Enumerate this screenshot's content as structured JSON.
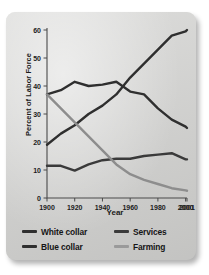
{
  "figure": {
    "panel_bg": "#d4d4d2",
    "page_bg": "#ffffff"
  },
  "chart_data": {
    "type": "line",
    "title": "",
    "xlabel": "Year",
    "ylabel": "Percent of Labor Force",
    "xlim": [
      1900,
      2001
    ],
    "ylim": [
      0,
      60
    ],
    "grid": false,
    "legend_position": "bottom",
    "x_tick_labels": [
      "1900",
      "1920",
      "1940",
      "1960",
      "1980",
      "2000",
      "2001"
    ],
    "x_tick_values": [
      1900,
      1920,
      1940,
      1960,
      1980,
      2000,
      2001
    ],
    "y_tick_labels": [
      "0",
      "10",
      "20",
      "30",
      "40",
      "50",
      "60"
    ],
    "y_tick_values": [
      0,
      10,
      20,
      30,
      40,
      50,
      60
    ],
    "x": [
      1900,
      1910,
      1920,
      1930,
      1940,
      1950,
      1960,
      1970,
      1980,
      1990,
      2000,
      2001
    ],
    "series": [
      {
        "name": "White collar",
        "color": "#2f2f2f",
        "values": [
          19,
          23,
          26,
          30,
          33,
          37,
          43,
          48,
          53,
          58,
          59.5,
          60
        ]
      },
      {
        "name": "Blue collar",
        "color": "#2f2f2f",
        "values": [
          37,
          38.5,
          41.5,
          40,
          40.5,
          41.5,
          38,
          37,
          32,
          28,
          25.5,
          25
        ]
      },
      {
        "name": "Services",
        "color": "#3a3a3a",
        "values": [
          11.5,
          11.5,
          9.8,
          12,
          13.5,
          14,
          14,
          15,
          15.5,
          16,
          13.8,
          13.8
        ]
      },
      {
        "name": "Farming",
        "color": "#8d8d8d",
        "values": [
          37,
          32,
          27,
          22,
          17,
          12,
          8.5,
          6.5,
          5,
          3.5,
          2.7,
          2.6
        ]
      }
    ]
  },
  "legend": {
    "entries": [
      {
        "label": "White collar",
        "color": "#2f2f2f"
      },
      {
        "label": "Services",
        "color": "#3a3a3a"
      },
      {
        "label": "Blue collar",
        "color": "#2f2f2f"
      },
      {
        "label": "Farming",
        "color": "#9a9a9a"
      }
    ]
  }
}
